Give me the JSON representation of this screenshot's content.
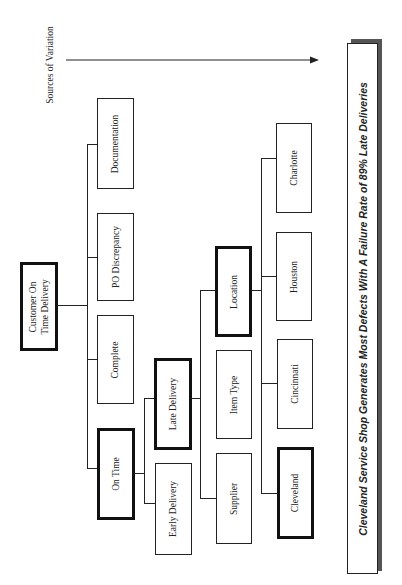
{
  "diagram": {
    "axis_label": "Sources of Variation",
    "root": {
      "label": "Customer On\nTime Delivery",
      "label_line1": "Customer On",
      "label_line2": "Time Delivery",
      "highlighted": true
    },
    "level1": [
      {
        "label": "Documentation",
        "highlighted": false
      },
      {
        "label": "PO Discrepancy",
        "highlighted": false
      },
      {
        "label": "Complete",
        "highlighted": false
      },
      {
        "label": "On Time",
        "highlighted": true
      }
    ],
    "level2": [
      {
        "label": "Late Delivery",
        "highlighted": true
      },
      {
        "label": "Early Delivery",
        "highlighted": false
      }
    ],
    "level3": [
      {
        "label": "Location",
        "highlighted": true
      },
      {
        "label": "Item Type",
        "highlighted": false
      },
      {
        "label": "Supplier",
        "highlighted": false
      }
    ],
    "level4": [
      {
        "label": "Charlotte",
        "highlighted": false
      },
      {
        "label": "Houston",
        "highlighted": false
      },
      {
        "label": "Cincinnati",
        "highlighted": false
      },
      {
        "label": "Cleveland",
        "highlighted": true
      }
    ],
    "conclusion": "Cleveland Service Shop Generates Most Defects With A Failure Rate of 89% Late Deliveries"
  }
}
